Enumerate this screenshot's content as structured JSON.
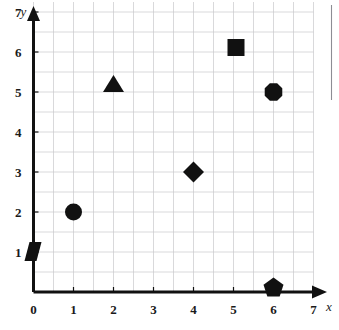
{
  "chart_data": {
    "type": "scatter",
    "title": "",
    "xlabel": "x",
    "ylabel": "y",
    "xlim": [
      0,
      7.6
    ],
    "ylim": [
      0,
      7.6
    ],
    "xticks": [
      0,
      1,
      2,
      3,
      4,
      5,
      6,
      7
    ],
    "yticks": [
      1,
      2,
      3,
      4,
      5,
      6,
      7
    ],
    "xtick_labels": [
      "0",
      "1",
      "2",
      "3",
      "4",
      "5",
      "6",
      "7"
    ],
    "ytick_labels": [
      "1",
      "2",
      "3",
      "4",
      "5",
      "6",
      "7"
    ],
    "grid": true,
    "grid_spacing": 1,
    "legend": false,
    "legend_position": "none",
    "marker_color": "#111111",
    "grid_color": "#c8c8cc",
    "axis_color": "#111111",
    "points": [
      {
        "label": "rhombus-marker",
        "shape": "rhombus",
        "x": 0,
        "y": 1
      },
      {
        "label": "circle-marker",
        "shape": "circle",
        "x": 1,
        "y": 2
      },
      {
        "label": "triangle-marker",
        "shape": "triangle",
        "x": 2,
        "y": 5
      },
      {
        "label": "diamond-marker",
        "shape": "diamond",
        "x": 4,
        "y": 3
      },
      {
        "label": "square-marker",
        "shape": "square",
        "x": 5,
        "y": 6
      },
      {
        "label": "octagon-marker",
        "shape": "octagon",
        "x": 6,
        "y": 5
      },
      {
        "label": "pentagon-marker",
        "shape": "pentagon",
        "x": 6,
        "y": 0
      }
    ]
  },
  "axes": {
    "x_axis_name": "x",
    "y_axis_name": "y"
  }
}
